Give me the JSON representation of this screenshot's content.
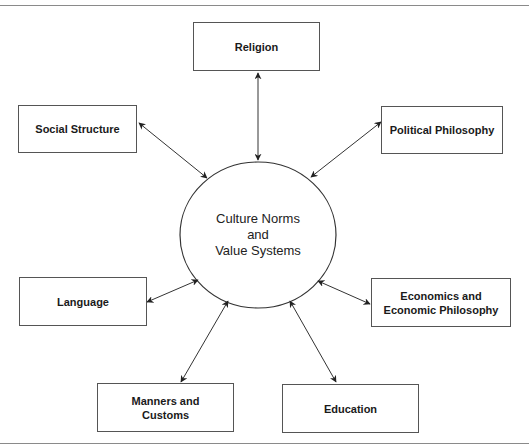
{
  "diagram": {
    "center": {
      "line1": "Culture Norms",
      "line2": "and",
      "line3": "Value Systems"
    },
    "nodes": {
      "religion": "Religion",
      "social_structure": "Social Structure",
      "political_philosophy": "Political Philosophy",
      "language": "Language",
      "economics": "Economics and Economic Philosophy",
      "manners": "Manners and Customs",
      "education": "Education"
    },
    "edges": [
      {
        "from": "center",
        "to": "religion",
        "type": "bidirectional"
      },
      {
        "from": "center",
        "to": "social_structure",
        "type": "bidirectional"
      },
      {
        "from": "center",
        "to": "political_philosophy",
        "type": "bidirectional"
      },
      {
        "from": "center",
        "to": "language",
        "type": "bidirectional"
      },
      {
        "from": "center",
        "to": "economics",
        "type": "bidirectional"
      },
      {
        "from": "center",
        "to": "manners",
        "type": "bidirectional"
      },
      {
        "from": "center",
        "to": "education",
        "type": "bidirectional"
      }
    ]
  }
}
